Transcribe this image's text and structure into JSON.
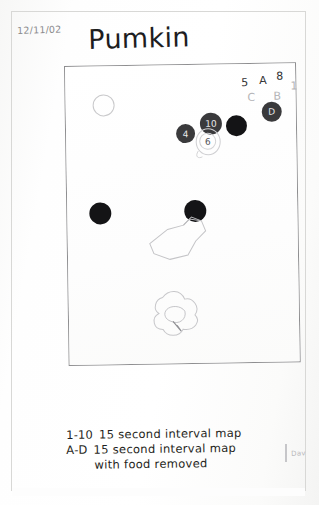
{
  "page": {
    "kind": "scanned-handwritten-observation-sheet",
    "date": "12/11/02",
    "title": "Pumkin",
    "initials_mark": "Dav"
  },
  "arena": {
    "label": "hand-drawn rectangular arena boundary"
  },
  "corner_annotations": [
    {
      "char": "5",
      "x": 176,
      "y": 12,
      "faint": false
    },
    {
      "char": "A",
      "x": 194,
      "y": 10,
      "faint": false
    },
    {
      "char": "8",
      "x": 211,
      "y": 6,
      "faint": false
    },
    {
      "char": "C",
      "x": 182,
      "y": 27,
      "faint": true
    },
    {
      "char": "B",
      "x": 208,
      "y": 26,
      "faint": true
    },
    {
      "char": "1",
      "x": 225,
      "y": 16,
      "faint": true
    }
  ],
  "marks": [
    {
      "name": "mark-A-oval",
      "style": "outline",
      "x": 27,
      "y": 28,
      "size": 20,
      "label": "",
      "label_dark": true
    },
    {
      "name": "mark-D-dot",
      "style": "gray",
      "x": 196,
      "y": 38,
      "size": 20,
      "label": "D",
      "label_dark": false
    },
    {
      "name": "mark-4-dot",
      "style": "gray",
      "x": 110,
      "y": 59,
      "size": 19,
      "label": "4",
      "label_dark": false
    },
    {
      "name": "mark-10-dot",
      "style": "gray",
      "x": 134,
      "y": 48,
      "size": 22,
      "label": "10",
      "label_dark": false
    },
    {
      "name": "mark-black-1",
      "style": "solid",
      "x": 160,
      "y": 51,
      "size": 21,
      "label": "",
      "label_dark": false
    },
    {
      "name": "mark-6-faint",
      "style": "faint",
      "x": 133,
      "y": 68,
      "size": 15,
      "label": "6",
      "label_dark": true
    },
    {
      "name": "mark-black-2",
      "style": "solid",
      "x": 22,
      "y": 136,
      "size": 22,
      "label": "",
      "label_dark": false
    },
    {
      "name": "mark-black-3",
      "style": "solid",
      "x": 117,
      "y": 135,
      "size": 22,
      "label": "",
      "label_dark": false
    }
  ],
  "caption": {
    "line_1_lead": "1-10",
    "line_1_text": "15 second   interval map",
    "line_2_lead": "A-D",
    "line_2_text": "15 second   interval map",
    "line_3_text": "with food removed"
  }
}
